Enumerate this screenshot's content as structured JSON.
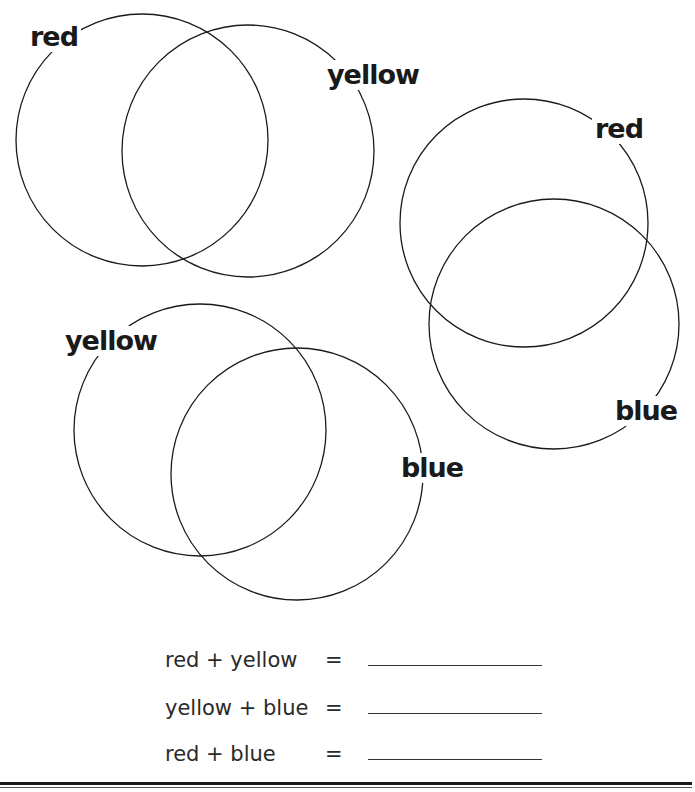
{
  "diagrams": [
    {
      "name": "red-yellow",
      "circles": [
        {
          "label": "red",
          "cx": 142,
          "cy": 140,
          "r": 126
        },
        {
          "label": "yellow",
          "cx": 248,
          "cy": 151,
          "r": 126
        }
      ]
    },
    {
      "name": "red-blue",
      "circles": [
        {
          "label": "red",
          "cx": 524,
          "cy": 223,
          "r": 124
        },
        {
          "label": "blue",
          "cx": 554,
          "cy": 324,
          "r": 125
        }
      ]
    },
    {
      "name": "yellow-blue",
      "circles": [
        {
          "label": "yellow",
          "cx": 200,
          "cy": 430,
          "r": 126
        },
        {
          "label": "blue",
          "cx": 297,
          "cy": 474,
          "r": 126
        }
      ]
    }
  ],
  "labels": {
    "top_red": "red",
    "top_yellow": "yellow",
    "right_red": "red",
    "right_blue": "blue",
    "bottom_yellow": "yellow",
    "bottom_blue": "blue"
  },
  "equations": [
    {
      "left": "red + yellow",
      "sign": "=",
      "answer": ""
    },
    {
      "left": "yellow + blue",
      "sign": "=",
      "answer": ""
    },
    {
      "left": "red + blue",
      "sign": "=",
      "answer": ""
    }
  ],
  "colors": {
    "stroke": "#1a1a1a",
    "background": "#ffffff"
  }
}
